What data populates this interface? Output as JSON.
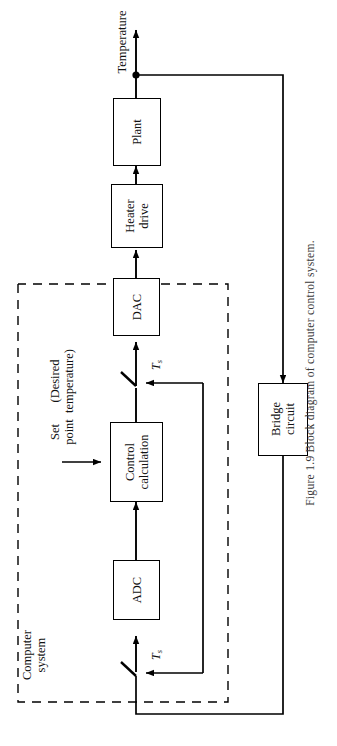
{
  "figure": {
    "number": "Figure 1.9",
    "caption": "Block diagram of computer control system.",
    "full_caption": "Figure 1.9   Block diagram of computer control system."
  },
  "blocks": [
    {
      "id": "plant",
      "label_line1": "Plant",
      "label_line2": ""
    },
    {
      "id": "heater",
      "label_line1": "Heater",
      "label_line2": "drive"
    },
    {
      "id": "dac",
      "label_line1": "DAC",
      "label_line2": ""
    },
    {
      "id": "control",
      "label_line1": "Control",
      "label_line2": "calculation"
    },
    {
      "id": "adc",
      "label_line1": "ADC",
      "label_line2": ""
    },
    {
      "id": "bridge",
      "label_line1": "Bridge",
      "label_line2": "circuit"
    }
  ],
  "labels": {
    "temperature": "Temperature",
    "set_point_line1": "Set",
    "set_point_line2": "point",
    "desired_line1": "(Desired",
    "desired_line2": "temperature)",
    "computer_system_line1": "Computer",
    "computer_system_line2": "system",
    "sampler_top": "T",
    "sampler_top_sub": "s",
    "sampler_bottom": "T",
    "sampler_bottom_sub": "s"
  },
  "colors": {
    "line": "#000000",
    "background": "#ffffff",
    "text": "#1a1a1a"
  }
}
